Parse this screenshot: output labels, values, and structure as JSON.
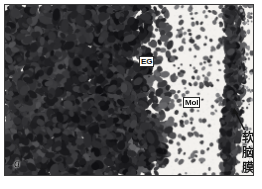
{
  "figure": {
    "panel_label": "a",
    "type": "histology-micrograph",
    "modality": "light-microscopy-grayscale"
  },
  "annotations": {
    "egl": {
      "text": "EG",
      "full_name": "external granular layer",
      "x": 134,
      "y": 51
    },
    "mol": {
      "text": "Mol",
      "full_name": "molecular layer",
      "x": 178,
      "y": 92
    },
    "pia": {
      "text": "软\n脑\n膜",
      "full_name": "pia mater",
      "x": 236,
      "y": 126,
      "has_arrow": true
    }
  },
  "frame": {
    "border_color": "#3a3a3a",
    "background_color": "#ffffff",
    "plate_background": "#f2f0ee"
  },
  "image_content": {
    "description": "Dense dark-stained nuclei fill the left two-thirds; sparse scattered nuclei on the right; a vertical band of stained cells runs near the right margin representing the pia mater.",
    "stain_color": "#1b1b1b",
    "tissue_background": "#f4f2ef",
    "regions": [
      {
        "name": "dense-granular-zone",
        "density": "high",
        "x_range": [
          0,
          0.52
        ]
      },
      {
        "name": "transition-zone",
        "density": "medium",
        "x_range": [
          0.52,
          0.66
        ]
      },
      {
        "name": "sparse-molecular-zone",
        "density": "low",
        "x_range": [
          0.66,
          0.9
        ]
      },
      {
        "name": "pia-mater-band",
        "density": "medium-linear",
        "x_range": [
          0.9,
          0.98
        ]
      }
    ]
  }
}
